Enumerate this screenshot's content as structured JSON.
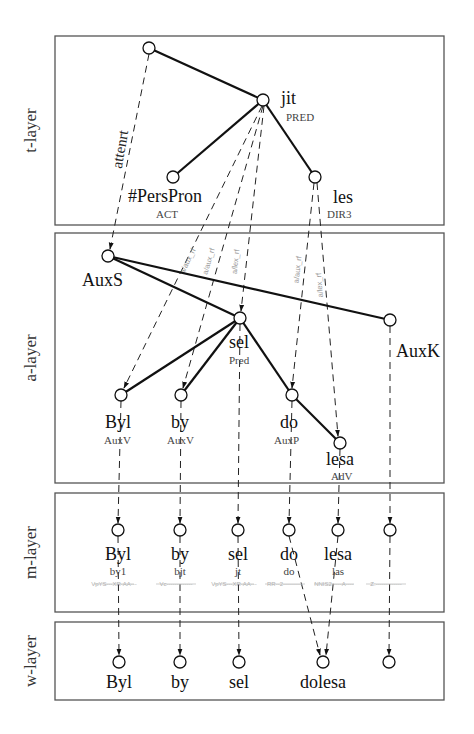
{
  "layers": [
    {
      "id": "t",
      "label": "t-layer",
      "box": [
        55,
        36,
        389,
        189
      ]
    },
    {
      "id": "a",
      "label": "a-layer",
      "box": [
        55,
        233,
        389,
        250
      ]
    },
    {
      "id": "m",
      "label": "m-layer",
      "box": [
        55,
        493,
        389,
        119
      ]
    },
    {
      "id": "w",
      "label": "w-layer",
      "box": [
        55,
        622,
        389,
        78
      ]
    }
  ],
  "t_layer": {
    "nodes": [
      {
        "id": "t0",
        "x": 149,
        "y": 48,
        "word": "",
        "func": ""
      },
      {
        "id": "t1",
        "x": 263,
        "y": 100,
        "word": "jit",
        "func": "PRED",
        "wx": 281,
        "wy": 104,
        "fx": 286,
        "fy": 121
      },
      {
        "id": "t2",
        "x": 173,
        "y": 177,
        "word": "#PersPron",
        "func": "ACT",
        "wx": 128,
        "wy": 202,
        "fx": 156,
        "fy": 218
      },
      {
        "id": "t3",
        "x": 315,
        "y": 177,
        "word": "les",
        "func": "DIR3",
        "wx": 333,
        "wy": 203,
        "fx": 327,
        "fy": 218
      }
    ],
    "edges": [
      [
        "t0",
        "t1"
      ],
      [
        "t1",
        "t2"
      ],
      [
        "t1",
        "t3"
      ]
    ],
    "attr_label": {
      "text": "attenrt",
      "x": 125,
      "y": 150,
      "rotate": -80
    }
  },
  "a_layer": {
    "nodes": [
      {
        "id": "a0",
        "x": 108,
        "y": 256,
        "word": "AuxS",
        "func": "",
        "wx": 82,
        "wy": 286
      },
      {
        "id": "a1",
        "x": 240,
        "y": 318,
        "word": "sel",
        "func": "Pred",
        "wx": 229,
        "wy": 348,
        "fx": 229,
        "fy": 364
      },
      {
        "id": "a2",
        "x": 390,
        "y": 320,
        "word": "AuxK",
        "func": "",
        "wx": 396,
        "wy": 357
      },
      {
        "id": "a3",
        "x": 121,
        "y": 395,
        "word": "Byl",
        "func": "AuxV",
        "wx": 105,
        "wy": 428,
        "fx": 104,
        "fy": 444
      },
      {
        "id": "a4",
        "x": 181,
        "y": 395,
        "word": "by",
        "func": "AuxV",
        "wx": 171,
        "wy": 428,
        "fx": 167,
        "fy": 444
      },
      {
        "id": "a5",
        "x": 292,
        "y": 395,
        "word": "do",
        "func": "AuxP",
        "wx": 280,
        "wy": 428,
        "fx": 274,
        "fy": 444
      },
      {
        "id": "a6",
        "x": 340,
        "y": 443,
        "word": "lesa",
        "func": "AdV",
        "wx": 326,
        "wy": 465,
        "fx": 331,
        "fy": 480
      }
    ],
    "edges": [
      [
        "a0",
        "a1"
      ],
      [
        "a0",
        "a2"
      ],
      [
        "a1",
        "a3"
      ],
      [
        "a1",
        "a4"
      ],
      [
        "a1",
        "a5"
      ],
      [
        "a5",
        "a6"
      ]
    ]
  },
  "m_layer": {
    "nodes": [
      {
        "id": "m0",
        "x": 118,
        "y": 530,
        "form": "Byl",
        "lemma": "by1",
        "tag": "VpYS---XR-AA---"
      },
      {
        "id": "m1",
        "x": 180,
        "y": 530,
        "form": "by",
        "lemma": "bjt",
        "tag": "Vc-------------"
      },
      {
        "id": "m2",
        "x": 238,
        "y": 530,
        "form": "sel",
        "lemma": "jt",
        "tag": "VpYS---XR-AA---"
      },
      {
        "id": "m3",
        "x": 289,
        "y": 530,
        "form": "do",
        "lemma": "do",
        "tag": "RR--2----------"
      },
      {
        "id": "m4",
        "x": 338,
        "y": 530,
        "form": "lesa",
        "lemma": "las",
        "tag": "NNIS2-----A----"
      },
      {
        "id": "m5",
        "x": 390,
        "y": 530,
        "form": "",
        "lemma": "",
        "tag": "Z:-------------"
      }
    ]
  },
  "w_layer": {
    "nodes": [
      {
        "id": "w0",
        "x": 119,
        "y": 662,
        "token": "Byl"
      },
      {
        "id": "w1",
        "x": 180,
        "y": 662,
        "token": "by"
      },
      {
        "id": "w2",
        "x": 239,
        "y": 662,
        "token": "sel"
      },
      {
        "id": "w3",
        "x": 323,
        "y": 662,
        "token": "dolesa"
      },
      {
        "id": "w4",
        "x": 389,
        "y": 662,
        "token": ""
      }
    ]
  },
  "links": [
    {
      "from": [
        149,
        54
      ],
      "to": [
        110,
        249
      ],
      "label": ""
    },
    {
      "from": [
        262,
        106
      ],
      "to": [
        124,
        388
      ],
      "label": "a/aux_rf",
      "lx": 190,
      "ly": 262
    },
    {
      "from": [
        263,
        106
      ],
      "to": [
        183,
        388
      ],
      "label": "a/aux_rf",
      "lx": 211,
      "ly": 262
    },
    {
      "from": [
        264,
        106
      ],
      "to": [
        241,
        311
      ],
      "label": "a/lex_rf",
      "lx": 238,
      "ly": 262
    },
    {
      "from": [
        314,
        183
      ],
      "to": [
        292,
        388
      ],
      "label": "a/aux_rf",
      "lx": 300,
      "ly": 270
    },
    {
      "from": [
        317,
        183
      ],
      "to": [
        338,
        436
      ],
      "label": "a/lex_rf",
      "lx": 322,
      "ly": 285
    },
    {
      "from": [
        121,
        401
      ],
      "to": [
        118,
        523
      ],
      "label": ""
    },
    {
      "from": [
        181,
        401
      ],
      "to": [
        180,
        523
      ],
      "label": ""
    },
    {
      "from": [
        240,
        324
      ],
      "to": [
        238,
        523
      ],
      "label": ""
    },
    {
      "from": [
        292,
        401
      ],
      "to": [
        289,
        523
      ],
      "label": ""
    },
    {
      "from": [
        340,
        449
      ],
      "to": [
        338,
        523
      ],
      "label": ""
    },
    {
      "from": [
        390,
        326
      ],
      "to": [
        390,
        523
      ],
      "label": ""
    },
    {
      "from": [
        118,
        536
      ],
      "to": [
        119,
        655
      ],
      "label": ""
    },
    {
      "from": [
        180,
        536
      ],
      "to": [
        180,
        655
      ],
      "label": ""
    },
    {
      "from": [
        238,
        536
      ],
      "to": [
        239,
        655
      ],
      "label": ""
    },
    {
      "from": [
        289,
        536
      ],
      "to": [
        320,
        655
      ],
      "label": ""
    },
    {
      "from": [
        338,
        536
      ],
      "to": [
        326,
        655
      ],
      "label": ""
    },
    {
      "from": [
        390,
        536
      ],
      "to": [
        389,
        655
      ],
      "label": ""
    }
  ]
}
